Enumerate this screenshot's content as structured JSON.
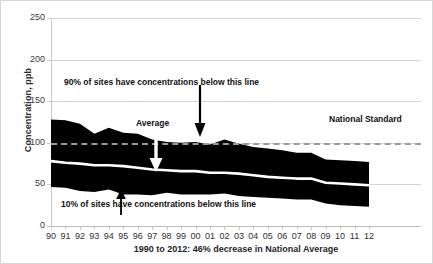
{
  "chart_data": {
    "type": "area",
    "title": "",
    "xlabel": "1990 to 2012: 46% decrease in National Average",
    "ylabel": "Concentration, ppb",
    "ylim": [
      0,
      250
    ],
    "yticks": [
      0,
      50,
      100,
      150,
      200,
      250
    ],
    "grid": true,
    "legend": "none",
    "categories": [
      "90",
      "91",
      "92",
      "93",
      "94",
      "95",
      "96",
      "97",
      "98",
      "99",
      "00",
      "01",
      "02",
      "03",
      "04",
      "05",
      "06",
      "07",
      "08",
      "09",
      "10",
      "11",
      "12"
    ],
    "series": [
      {
        "name": "90th percentile",
        "values": [
          128,
          127,
          123,
          111,
          118,
          112,
          111,
          104,
          101,
          100,
          101,
          98,
          104,
          99,
          95,
          93,
          91,
          88,
          88,
          80,
          79,
          78,
          77
        ]
      },
      {
        "name": "Average",
        "values": [
          78,
          76,
          75,
          73,
          73,
          72,
          70,
          68,
          67,
          66,
          66,
          64,
          64,
          63,
          61,
          59,
          58,
          57,
          57,
          52,
          51,
          50,
          49
        ]
      },
      {
        "name": "10th percentile",
        "values": [
          47,
          46,
          42,
          41,
          44,
          38,
          38,
          37,
          40,
          38,
          38,
          38,
          39,
          36,
          35,
          34,
          33,
          32,
          32,
          27,
          25,
          24,
          23
        ]
      }
    ],
    "reference_lines": [
      {
        "name": "National Standard",
        "value": 100,
        "style": "dashed",
        "label": "National Standard"
      }
    ],
    "annotations": [
      {
        "name": "p90-note",
        "text": "90% of sites have concentrations below this line",
        "points_to": "90th percentile band top",
        "arrow": "down"
      },
      {
        "name": "average-note",
        "text": "Average",
        "points_to": "Average line",
        "arrow": "down"
      },
      {
        "name": "p10-note",
        "text": "10% of sites have concentrations below this line",
        "points_to": "10th percentile band bottom",
        "arrow": "up"
      }
    ],
    "colors": {
      "band": "#000000",
      "average_line": "#ffffff",
      "standard_line": "#9a9a9a",
      "gridline": "#d4d4d4",
      "text": "#1f1f1f"
    }
  },
  "axes": {
    "y_title": "Concentration, ppb",
    "y_tick_labels": [
      "250",
      "200",
      "150",
      "100",
      "50",
      "0"
    ],
    "x_tick_labels": [
      "90",
      "91",
      "92",
      "93",
      "94",
      "95",
      "96",
      "97",
      "98",
      "99",
      "00",
      "01",
      "02",
      "03",
      "04",
      "05",
      "06",
      "07",
      "08",
      "09",
      "10",
      "11",
      "12"
    ],
    "x_title": "1990 to 2012: 46% decrease in National Average"
  },
  "labels": {
    "p90_note": "90% of sites have concentrations below this line",
    "p10_note": "10% of sites have concentrations below this line",
    "average_note": "Average",
    "national_standard": "National Standard"
  }
}
